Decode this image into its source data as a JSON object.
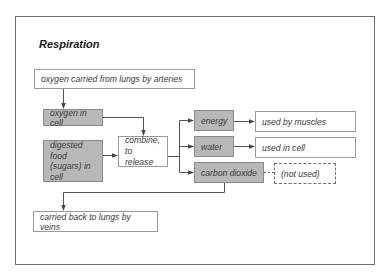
{
  "title": "Respiration",
  "boxes": {
    "arteries": "oxygen carried from lungs by arteries",
    "oxygen_in_cell": "oxygen in cell",
    "digested_food": "digested food (sugars) in cell",
    "combine": "combine, to release",
    "energy": "energy",
    "water": "water",
    "carbon_dioxide": "carbon dioxide",
    "used_by_muscles": "used by muscles",
    "used_in_cell": "used in cell",
    "not_used": "(not used)",
    "veins": "carried back to lungs by veins"
  },
  "colors": {
    "process_fill": "#b8b8b8",
    "line": "#555555"
  }
}
